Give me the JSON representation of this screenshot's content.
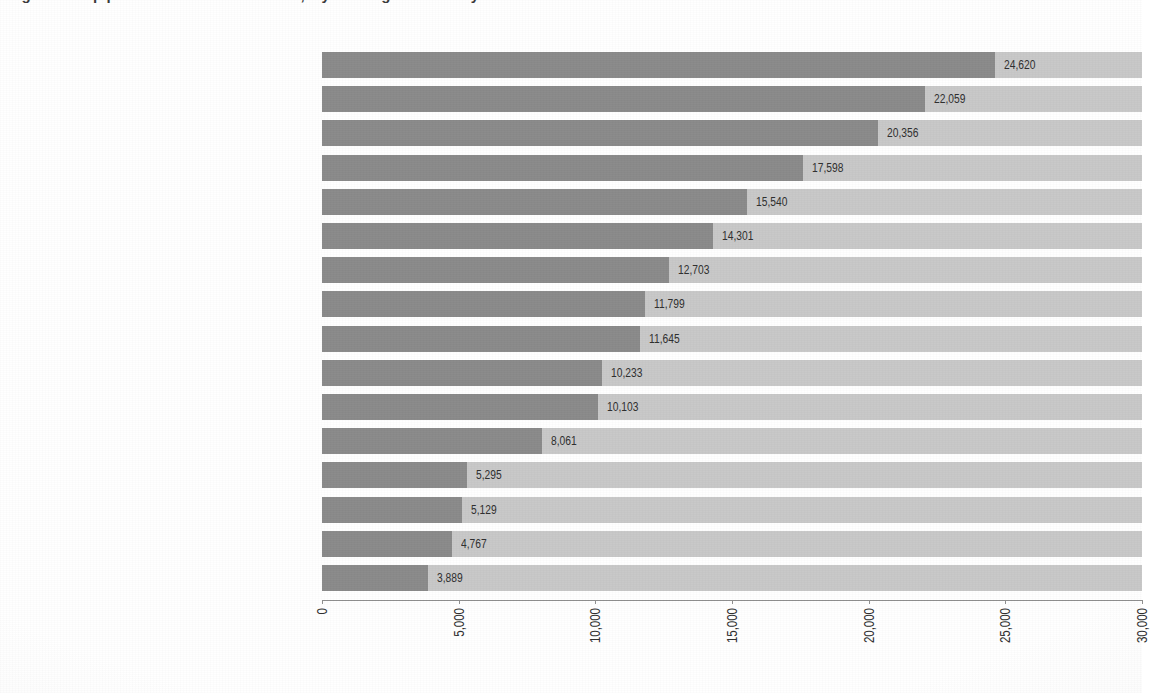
{
  "figure": {
    "cropped_title_fragment": "Figure 1.  Top priorities for a better world, My World global survey results",
    "background_color": "#ffffff",
    "bar_color": "#8a8a8a",
    "track_color": "#c8c8c8",
    "axis_color": "#8f8f8f",
    "text_color": "#2e2e2e"
  },
  "chart_data": {
    "type": "bar",
    "orientation": "horizontal",
    "title": "",
    "xlabel": "",
    "ylabel": "",
    "xlim": [
      0,
      30000
    ],
    "grid": false,
    "legend": "none",
    "tick_labels": [
      "0",
      "5,000",
      "10,000",
      "15,000",
      "20,000",
      "25,000",
      "30,000"
    ],
    "ticks": [
      0,
      5000,
      10000,
      15000,
      20000,
      25000,
      30000
    ],
    "categories": [
      "Good education",
      "Better job opportunities",
      "Better health care",
      "Honest and responsive government",
      "Protection from crime and violence",
      "Affordable and nutritious food",
      "Access to clean water and sanitation",
      "Better transport and roads",
      "Support for people who cannot work",
      "Freedom from discrimination and persecution",
      "Political freedoms",
      "Equality between men and women",
      "Protecting forests, rivers and oceans",
      "Reliable energy at home",
      "Phone and Internet access",
      "Action taken on climate change"
    ],
    "values": [
      24620,
      22059,
      20356,
      17598,
      15540,
      14301,
      12703,
      11799,
      11645,
      10233,
      10103,
      8061,
      5295,
      5129,
      4767,
      3889
    ],
    "value_labels": [
      "24,620",
      "22,059",
      "20,356",
      "17,598",
      "15,540",
      "14,301",
      "12,703",
      "11,799",
      "11,645",
      "10,233",
      "10,103",
      "8,061",
      "5,295",
      "5,129",
      "4,767",
      "3,889"
    ]
  }
}
